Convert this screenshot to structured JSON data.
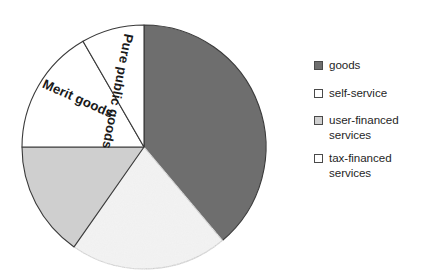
{
  "chart_data": {
    "type": "pie",
    "title": "",
    "subtitle": "",
    "xlabel": "",
    "ylabel": "",
    "grid": false,
    "legend_position": "right",
    "start_angle_deg": 0,
    "direction": "clockwise",
    "categories": [
      "goods",
      "tax-financed services",
      "user-financed services",
      "Merit goods",
      "Pure public goods"
    ],
    "values": [
      39,
      21,
      15,
      17,
      8
    ],
    "units": "percent",
    "slices": [
      {
        "name": "goods",
        "value": 39,
        "start_deg": 0,
        "end_deg": 140,
        "fill": "#6e6e6e",
        "stroke": "#3a3a3a",
        "in_pie_label": "",
        "texture": "solid"
      },
      {
        "name": "tax-financed services",
        "value": 21,
        "start_deg": 140,
        "end_deg": 215,
        "fill": "#fbfbfb",
        "stroke": "#3a3a3a",
        "in_pie_label": "",
        "texture": "speckled"
      },
      {
        "name": "user-financed services",
        "value": 15,
        "start_deg": 215,
        "end_deg": 270,
        "fill": "#cfcfcf",
        "stroke": "#3a3a3a",
        "in_pie_label": "",
        "texture": "solid"
      },
      {
        "name": "Merit goods",
        "value": 17,
        "start_deg": 270,
        "end_deg": 330,
        "fill": "#ffffff",
        "stroke": "#3a3a3a",
        "in_pie_label": "Merit goods",
        "texture": "solid"
      },
      {
        "name": "Pure public goods",
        "value": 8,
        "start_deg": 330,
        "end_deg": 360,
        "fill": "#ffffff",
        "stroke": "#3a3a3a",
        "in_pie_label": "Pure public goods",
        "texture": "solid"
      }
    ]
  },
  "pie": {
    "labels": {
      "pure_public_goods": "Pure public goods",
      "merit_goods": "Merit goods"
    }
  },
  "legend": {
    "items": [
      {
        "label": "goods",
        "line1": "goods",
        "line2": "",
        "swatch_color": "#6e6e6e",
        "swatch_name": "legend-swatch-goods"
      },
      {
        "label": "self-service",
        "line1": "self-service",
        "line2": "",
        "swatch_color": "#ffffff",
        "swatch_name": "legend-swatch-self-service"
      },
      {
        "label": "user-financed services",
        "line1": "user-financed",
        "line2": "services",
        "swatch_color": "#cfcfcf",
        "swatch_name": "legend-swatch-user-financed-services"
      },
      {
        "label": "tax-financed services",
        "line1": "tax-financed",
        "line2": "services",
        "swatch_color": "#ffffff",
        "swatch_name": "legend-swatch-tax-financed-services"
      }
    ]
  },
  "colors": {
    "dark_gray": "#6e6e6e",
    "light_gray": "#cfcfcf",
    "white": "#ffffff",
    "outline": "#3a3a3a",
    "text": "#1f1f1f",
    "background": "#ffffff"
  }
}
